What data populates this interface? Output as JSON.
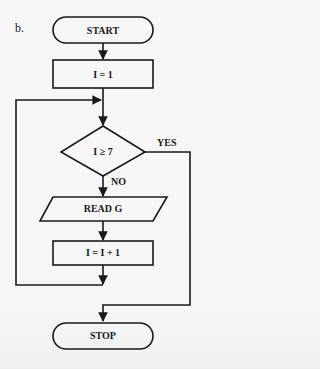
{
  "figure_label": "b.",
  "flowchart": {
    "nodes": [
      {
        "id": "start",
        "type": "terminator",
        "label": "START"
      },
      {
        "id": "init",
        "type": "process",
        "label": "I = 1"
      },
      {
        "id": "decision",
        "type": "decision",
        "label": "I ≥ 7"
      },
      {
        "id": "read",
        "type": "input-output",
        "label": "READ G"
      },
      {
        "id": "increment",
        "type": "process",
        "label": "I = I + 1"
      },
      {
        "id": "stop",
        "type": "terminator",
        "label": "STOP"
      }
    ],
    "edges": [
      {
        "from": "start",
        "to": "init",
        "label": ""
      },
      {
        "from": "init",
        "to": "decision",
        "label": ""
      },
      {
        "from": "decision",
        "to": "read",
        "label": "NO"
      },
      {
        "from": "decision",
        "to": "stop",
        "label": "YES"
      },
      {
        "from": "read",
        "to": "increment",
        "label": ""
      },
      {
        "from": "increment",
        "to": "decision",
        "label": "loop back"
      }
    ],
    "branch_labels": {
      "yes": "YES",
      "no": "NO"
    }
  },
  "colors": {
    "stroke": "#1a1a1a",
    "background": "#f6f6f6"
  }
}
